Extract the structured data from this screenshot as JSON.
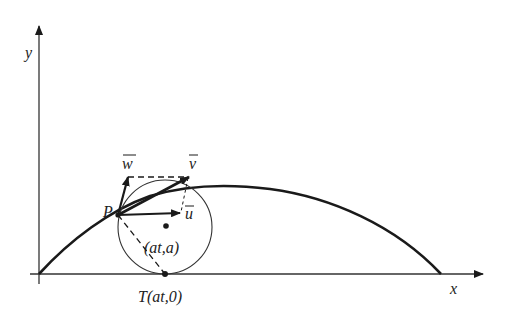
{
  "diagram": {
    "type": "cycloid-velocity-diagram",
    "colors": {
      "ink": "#1a1a1a",
      "axis": "#333333",
      "background": "#ffffff"
    },
    "axes": {
      "x_label": "x",
      "y_label": "y"
    },
    "labels": {
      "point_P": "P",
      "center": "(at,a)",
      "tangent_point": "T(at,0)",
      "vector_w": "w",
      "vector_v": "v",
      "vector_u": "u"
    },
    "vectors": [
      {
        "name": "w",
        "description": "vertical component"
      },
      {
        "name": "v",
        "description": "velocity, resultant"
      },
      {
        "name": "u",
        "description": "horizontal component"
      }
    ]
  }
}
